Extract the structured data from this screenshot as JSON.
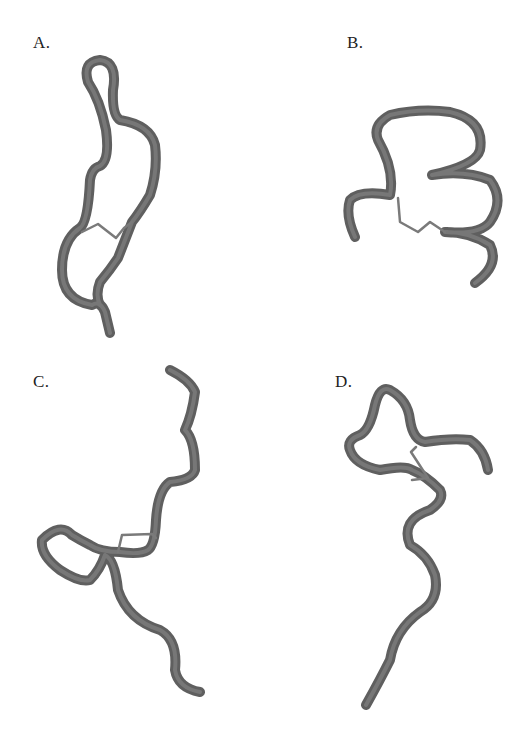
{
  "figure": {
    "panels": [
      {
        "id": "A",
        "label": "A.",
        "backbone": "M 110 333 L 105 312 Q 100 300 92 305 Q 62 300 62 270 Q 62 240 80 228 Q 88 222 90 180 Q 92 168 100 166 Q 110 160 106 130 Q 100 100 88 82 Q 82 62 100 60 Q 118 62 113 90 Q 112 115 120 120 Q 150 125 155 145 Q 158 170 150 195 Q 140 212 132 222 Q 125 240 118 258 Q 110 270 100 282 Q 95 295 100 305",
        "disulfide": "M 82 232 L 98 224 L 116 238 L 124 228 L 132 222"
      },
      {
        "id": "B",
        "label": "B.",
        "backbone": "M 355 237 Q 345 215 350 200 Q 360 190 390 195 Q 395 170 378 140 Q 372 125 390 115 Q 420 108 450 112 Q 485 120 480 150 Q 476 165 432 175 Q 465 170 490 180 Q 505 200 490 222 Q 480 235 445 232 Q 470 232 490 245 Q 500 265 475 283",
        "disulfide": "M 398 198 L 400 222 L 418 232 L 430 222 L 445 232"
      },
      {
        "id": "C",
        "label": "C.",
        "backbone": "M 170 370 Q 190 380 195 392 Q 192 415 185 430 Q 195 440 195 470 Q 192 480 170 482 Q 158 490 156 520 Q 155 545 148 550 Q 140 555 120 552 Q 100 552 90 545 Q 80 540 72 535 Q 60 522 42 540 Q 40 555 60 570 Q 80 583 90 580 Q 100 570 105 555 Q 115 560 118 590 Q 128 620 160 630 Q 178 640 175 670 Q 178 688 200 692",
        "disulfide": "M 118 552 L 122 535 L 152 534 L 156 538"
      },
      {
        "id": "D",
        "label": "D.",
        "backbone": "M 366 705 Q 380 680 390 660 Q 395 630 420 612 Q 440 600 435 575 Q 428 555 410 545 Q 400 520 430 510 Q 445 500 440 490 Q 425 475 412 470 Q 405 465 380 470 Q 355 465 350 450 Q 346 440 360 435 Q 370 430 375 405 Q 380 385 390 390 Q 408 400 410 420 Q 413 440 425 442 Q 450 438 470 440 Q 485 450 488 470",
        "disulfide": "M 416 447 L 411 452 L 428 478 L 412 480"
      }
    ]
  },
  "colors": {
    "tube_dark": "#5f5f5f",
    "tube_highlight": "#8a8a8a",
    "bond": "#7a7a7a",
    "label_text": "#222222",
    "background": "#ffffff"
  }
}
